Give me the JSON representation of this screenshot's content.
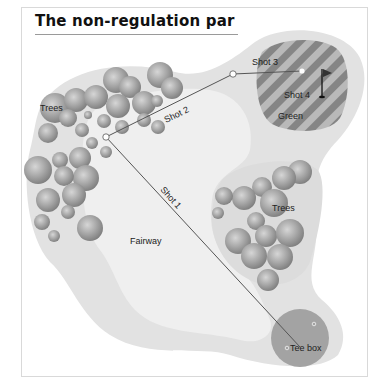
{
  "title": "The non-regulation par",
  "labels": {
    "trees_left": "Trees",
    "trees_right": "Trees",
    "fairway": "Fairway",
    "green": "Green",
    "tee_box": "Tee box",
    "shot1": "Shot 1",
    "shot2": "Shot 2",
    "shot3": "Shot 3",
    "shot4": "Shot 4"
  },
  "colors": {
    "rough": "#e3e3e3",
    "fairway": "#efefef",
    "green_dark": "#8a8a8a",
    "green_light": "#b8b8b8",
    "tee_box": "#a3a3a3",
    "tree": "#a0a0a0",
    "shot_line": "#555555"
  },
  "shots": [
    {
      "name": "Shot 1",
      "from": [
        300,
        347
      ],
      "to": [
        106,
        137
      ]
    },
    {
      "name": "Shot 2",
      "from": [
        106,
        137
      ],
      "to": [
        233,
        74
      ]
    },
    {
      "name": "Shot 3",
      "from": [
        233,
        74
      ],
      "to": [
        302,
        71
      ]
    },
    {
      "name": "Shot 4",
      "from": [
        302,
        71
      ],
      "to": [
        322,
        97
      ]
    }
  ]
}
